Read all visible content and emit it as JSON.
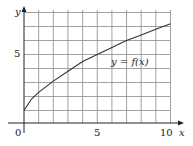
{
  "chart_data": {
    "type": "line",
    "title": "",
    "xlabel": "x",
    "ylabel": "y",
    "curve_label": "y = f(x)",
    "x_ticks": [
      {
        "value": 0,
        "label": "0"
      },
      {
        "value": 5,
        "label": "5"
      },
      {
        "value": 10,
        "label": "10"
      }
    ],
    "y_ticks": [
      {
        "value": 5,
        "label": "5"
      }
    ],
    "xlim": [
      0,
      10
    ],
    "ylim": [
      0,
      8
    ],
    "grid": true,
    "grid_step": 1,
    "series": [
      {
        "name": "y = f(x)",
        "x": [
          0,
          0.5,
          1,
          2,
          3,
          4,
          5,
          6,
          7,
          8,
          9,
          10
        ],
        "y": [
          1.0,
          1.8,
          2.3,
          3.1,
          3.8,
          4.5,
          5.0,
          5.5,
          6.0,
          6.4,
          6.8,
          7.2
        ]
      }
    ]
  },
  "labels": {
    "x_axis": "x",
    "y_axis": "y",
    "curve": "y = f(x)",
    "x_tick_0": "0",
    "x_tick_5": "5",
    "x_tick_10": "10",
    "y_tick_5": "5"
  }
}
